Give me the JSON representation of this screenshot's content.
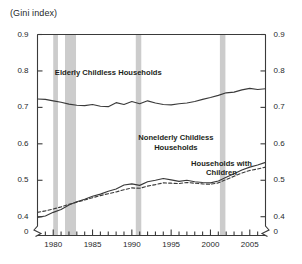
{
  "chart_data": {
    "type": "line",
    "title": "(Gini index)",
    "xlabel": "",
    "ylabel": "(Gini index)",
    "ylim": [
      0.35,
      0.9
    ],
    "xlim": [
      1978,
      2007
    ],
    "grid": false,
    "legend_position": "inline-annotations",
    "axis_break": true,
    "axis_break_label": "0",
    "y_ticks": [
      "0.9",
      "0.8",
      "0.7",
      "0.6",
      "0.5",
      "0.4",
      "0"
    ],
    "y_tick_values": [
      0.9,
      0.8,
      0.7,
      0.6,
      0.5,
      0.4,
      0.0
    ],
    "y_ticks_right": [
      "0.9",
      "0.8",
      "0.7",
      "0.6",
      "0.5",
      "0.4",
      "0"
    ],
    "x_ticks": [
      "1980",
      "1985",
      "1990",
      "1995",
      "2000",
      "2005"
    ],
    "x_tick_values": [
      1980,
      1985,
      1990,
      1995,
      2000,
      2005
    ],
    "x_minor_ticks": [
      1978,
      1979,
      1980,
      1981,
      1982,
      1983,
      1984,
      1985,
      1986,
      1987,
      1988,
      1989,
      1990,
      1991,
      1992,
      1993,
      1994,
      1995,
      1996,
      1997,
      1998,
      1999,
      2000,
      2001,
      2002,
      2003,
      2004,
      2005,
      2006,
      2007
    ],
    "recession_bands": [
      {
        "start": 1980.0,
        "end": 1980.6
      },
      {
        "start": 1981.5,
        "end": 1982.9
      },
      {
        "start": 1990.5,
        "end": 1991.2
      },
      {
        "start": 2001.2,
        "end": 2001.9
      }
    ],
    "recession_color": "#cccccc",
    "line_color": "#3a3a3a",
    "x": [
      1978,
      1979,
      1980,
      1981,
      1982,
      1983,
      1984,
      1985,
      1986,
      1987,
      1988,
      1989,
      1990,
      1991,
      1992,
      1993,
      1994,
      1995,
      1996,
      1997,
      1998,
      1999,
      2000,
      2001,
      2002,
      2003,
      2004,
      2005,
      2006,
      2007
    ],
    "series": [
      {
        "name": "Elderly Childless Households",
        "style": "solid",
        "label_x": 1987.0,
        "label_y": 0.795,
        "values": [
          0.723,
          0.722,
          0.718,
          0.714,
          0.709,
          0.706,
          0.705,
          0.708,
          0.703,
          0.702,
          0.713,
          0.708,
          0.716,
          0.71,
          0.718,
          0.712,
          0.708,
          0.707,
          0.71,
          0.712,
          0.716,
          0.722,
          0.727,
          0.733,
          0.74,
          0.742,
          0.748,
          0.752,
          0.749,
          0.751
        ]
      },
      {
        "name": "Nonelderly Childless Households",
        "style": "solid",
        "label_x": 1995.6,
        "label_y": 0.615,
        "values": [
          0.398,
          0.402,
          0.412,
          0.42,
          0.432,
          0.441,
          0.448,
          0.456,
          0.462,
          0.47,
          0.476,
          0.487,
          0.49,
          0.486,
          0.496,
          0.5,
          0.505,
          0.501,
          0.497,
          0.5,
          0.496,
          0.494,
          0.493,
          0.498,
          0.508,
          0.518,
          0.528,
          0.536,
          0.542,
          0.549
        ]
      },
      {
        "name": "Households with Children",
        "style": "dashed",
        "label_x": 2001.4,
        "label_y": 0.545,
        "values": [
          0.412,
          0.416,
          0.421,
          0.427,
          0.434,
          0.44,
          0.446,
          0.452,
          0.458,
          0.463,
          0.468,
          0.474,
          0.479,
          0.478,
          0.484,
          0.488,
          0.493,
          0.492,
          0.491,
          0.494,
          0.492,
          0.49,
          0.489,
          0.493,
          0.502,
          0.511,
          0.52,
          0.527,
          0.531,
          0.536
        ]
      }
    ]
  },
  "footnote": {
    "text": ""
  }
}
